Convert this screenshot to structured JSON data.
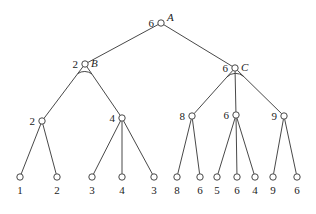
{
  "diagram": {
    "type": "game-tree",
    "root": {
      "name": "A",
      "value": "6",
      "x": 161,
      "y": 23
    },
    "nodes": [
      {
        "id": "A",
        "name": "A",
        "value": "6",
        "x": 161,
        "y": 23,
        "parent": null
      },
      {
        "id": "B",
        "name": "B",
        "value": "2",
        "x": 85,
        "y": 64,
        "parent": "A",
        "arc": true
      },
      {
        "id": "C",
        "name": "C",
        "value": "6",
        "x": 235,
        "y": 68,
        "parent": "A",
        "arc": true
      },
      {
        "id": "B1",
        "value": "2",
        "x": 42,
        "y": 121,
        "parent": "B"
      },
      {
        "id": "B2",
        "value": "4",
        "x": 122,
        "y": 118,
        "parent": "B"
      },
      {
        "id": "C1",
        "value": "8",
        "x": 192,
        "y": 116,
        "parent": "C"
      },
      {
        "id": "C2",
        "value": "6",
        "x": 236,
        "y": 115,
        "parent": "C"
      },
      {
        "id": "C3",
        "value": "9",
        "x": 284,
        "y": 116,
        "parent": "C"
      }
    ],
    "leaves": [
      {
        "value": "1",
        "x": 20,
        "y": 177,
        "parent": "B1"
      },
      {
        "value": "2",
        "x": 57,
        "y": 177,
        "parent": "B1"
      },
      {
        "value": "3",
        "x": 92,
        "y": 177,
        "parent": "B2"
      },
      {
        "value": "4",
        "x": 122,
        "y": 177,
        "parent": "B2"
      },
      {
        "value": "3",
        "x": 154,
        "y": 177,
        "parent": "B2"
      },
      {
        "value": "8",
        "x": 177,
        "y": 177,
        "parent": "C1"
      },
      {
        "value": "6",
        "x": 200,
        "y": 177,
        "parent": "C1"
      },
      {
        "value": "5",
        "x": 217,
        "y": 177,
        "parent": "C2"
      },
      {
        "value": "6",
        "x": 237,
        "y": 177,
        "parent": "C2"
      },
      {
        "value": "4",
        "x": 255,
        "y": 177,
        "parent": "C2"
      },
      {
        "value": "9",
        "x": 273,
        "y": 177,
        "parent": "C3"
      },
      {
        "value": "6",
        "x": 297,
        "y": 177,
        "parent": "C3"
      }
    ]
  }
}
